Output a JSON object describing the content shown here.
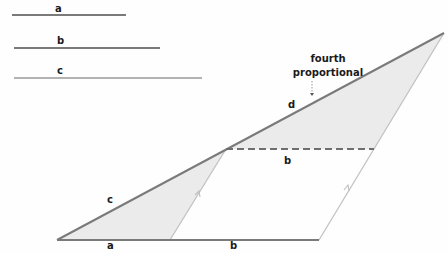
{
  "diagram": {
    "colors": {
      "line": "#7a7a7a",
      "thin_line": "#b5b5b5",
      "fill": "#ebebeb",
      "text": "#1a1a1a"
    },
    "segments": [
      {
        "label": "a",
        "x1": 12,
        "y1": 15,
        "x2": 126,
        "y2": 15,
        "lx": 55,
        "ly": 11
      },
      {
        "label": "b",
        "x1": 14,
        "y1": 48,
        "x2": 160,
        "y2": 48,
        "lx": 57,
        "ly": 44
      },
      {
        "label": "c",
        "x1": 14,
        "y1": 78,
        "x2": 202,
        "y2": 78,
        "lx": 57,
        "ly": 74
      }
    ],
    "labels": {
      "c_side": "c",
      "d_side": "d",
      "a_base": "a",
      "b_base": "b",
      "b_dashed": "b",
      "fourth": "fourth",
      "proportional": "proportional"
    },
    "points": {
      "O": [
        57,
        240
      ],
      "A": [
        170,
        240
      ],
      "B": [
        319,
        240
      ],
      "C": [
        226,
        149
      ],
      "D": [
        374,
        149
      ],
      "E": [
        444,
        33
      ]
    }
  }
}
